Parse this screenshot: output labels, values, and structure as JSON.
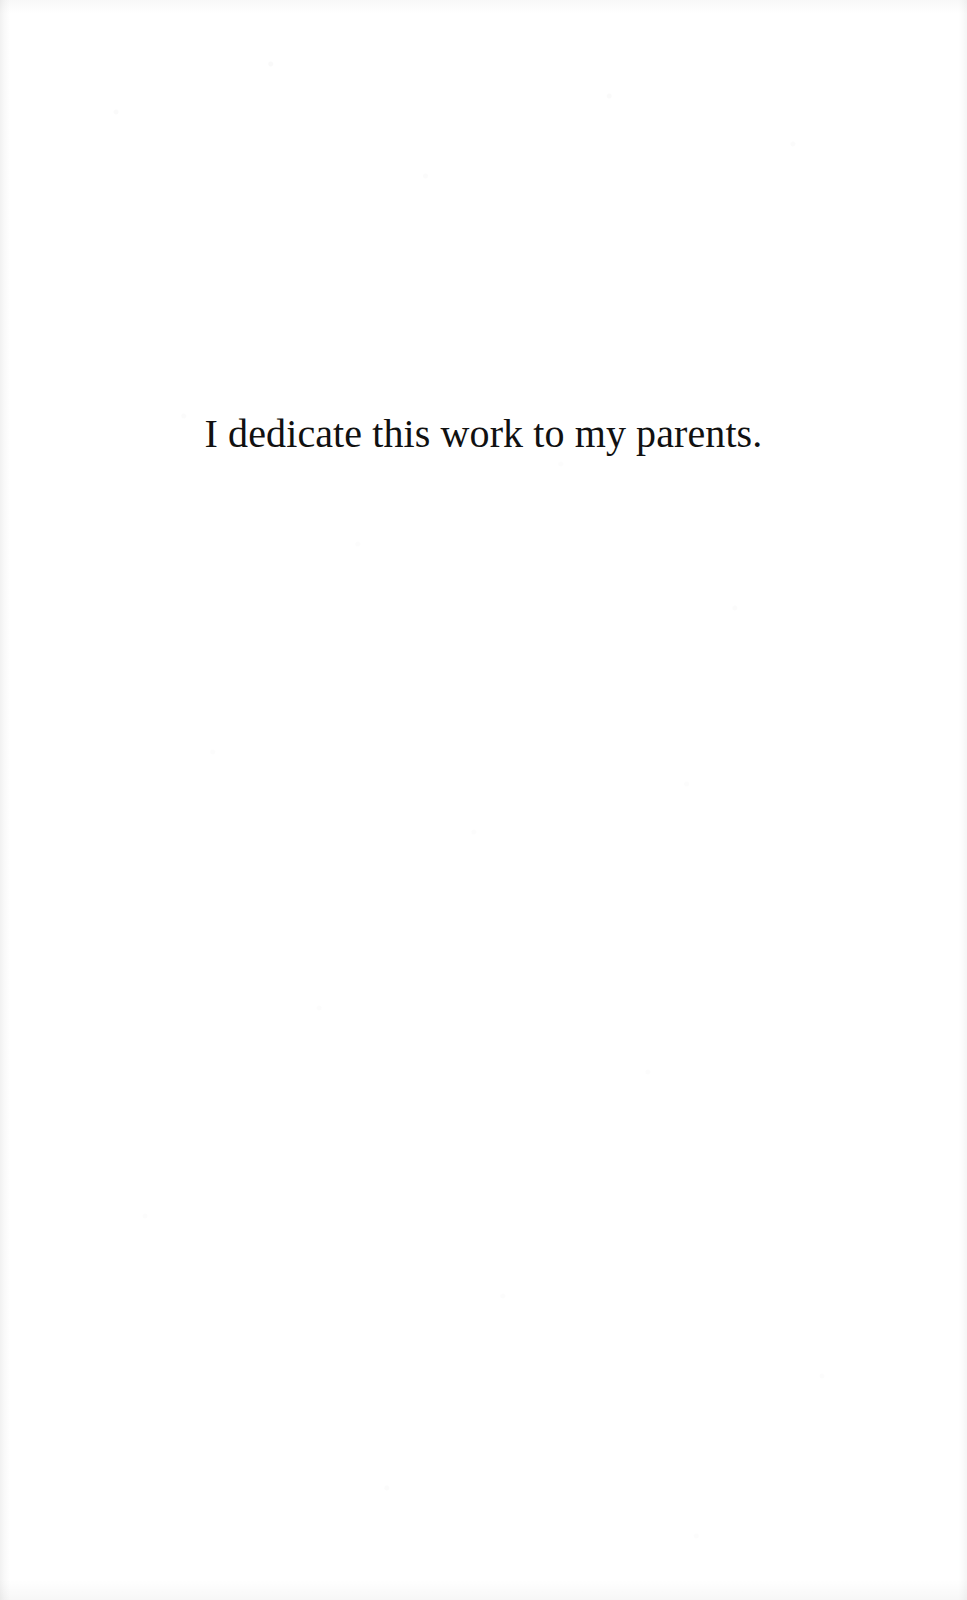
{
  "page": {
    "kind": "book-dedication-page",
    "background_color": "#ffffff",
    "text_color": "#111111",
    "width_px": 967,
    "height_px": 1600
  },
  "dedication": {
    "text": "I dedicate this work to my parents.",
    "alignment": "center"
  }
}
